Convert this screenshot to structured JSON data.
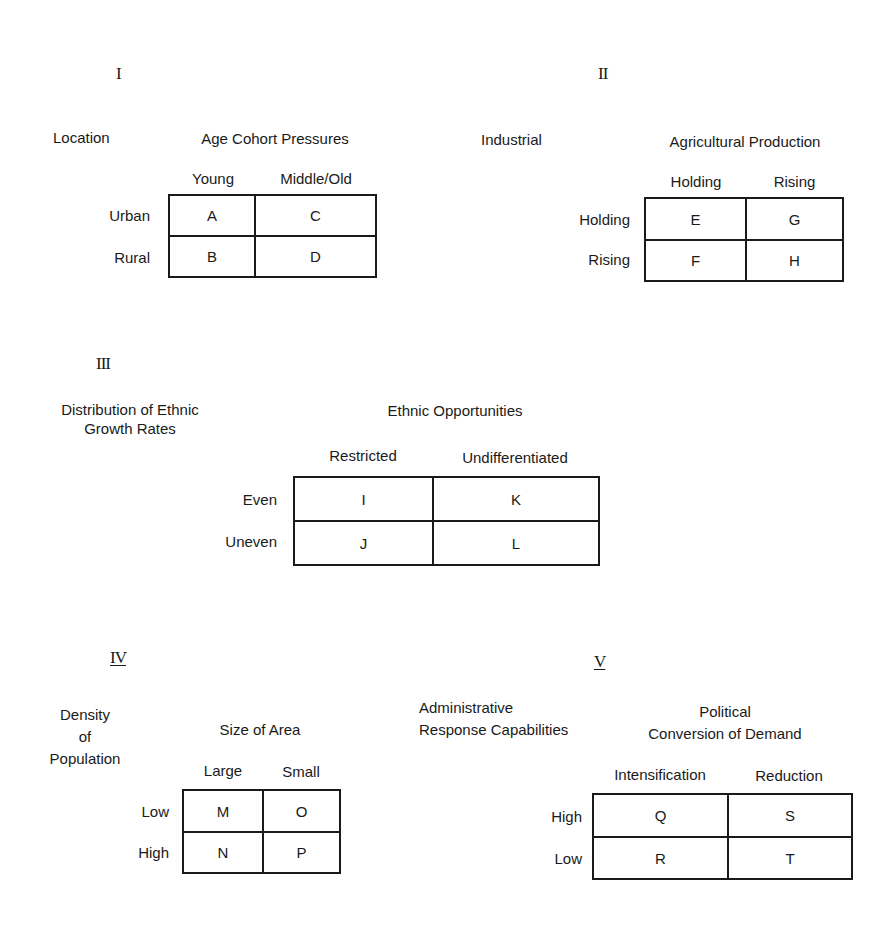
{
  "tables": [
    {
      "numeral": "I",
      "row_variable": "Location",
      "column_variable": "Age Cohort Pressures",
      "columns": [
        "Young",
        "Middle/Old"
      ],
      "rows": [
        "Urban",
        "Rural"
      ],
      "cells": [
        [
          "A",
          "C"
        ],
        [
          "B",
          "D"
        ]
      ]
    },
    {
      "numeral": "II",
      "row_variable": "Industrial",
      "column_variable": "Agricultural Production",
      "columns": [
        "Holding",
        "Rising"
      ],
      "rows": [
        "Holding",
        "Rising"
      ],
      "cells": [
        [
          "E",
          "G"
        ],
        [
          "F",
          "H"
        ]
      ]
    },
    {
      "numeral": "III",
      "row_variable_line1": "Distribution of Ethnic",
      "row_variable_line2": "Growth Rates",
      "column_variable": "Ethnic Opportunities",
      "columns": [
        "Restricted",
        "Undifferentiated"
      ],
      "rows": [
        "Even",
        "Uneven"
      ],
      "cells": [
        [
          "I",
          "K"
        ],
        [
          "J",
          "L"
        ]
      ]
    },
    {
      "numeral": "IV",
      "row_variable_line1": "Density",
      "row_variable_line2": "of",
      "row_variable_line3": "Population",
      "column_variable": "Size of Area",
      "columns": [
        "Large",
        "Small"
      ],
      "rows": [
        "Low",
        "High"
      ],
      "cells": [
        [
          "M",
          "O"
        ],
        [
          "N",
          "P"
        ]
      ]
    },
    {
      "numeral": "V",
      "row_variable_line1": "Administrative",
      "row_variable_line2": "Response Capabilities",
      "column_variable_line1": "Political",
      "column_variable_line2": "Conversion of Demand",
      "columns": [
        "Intensification",
        "Reduction"
      ],
      "rows": [
        "High",
        "Low"
      ],
      "cells": [
        [
          "Q",
          "S"
        ],
        [
          "R",
          "T"
        ]
      ]
    }
  ]
}
